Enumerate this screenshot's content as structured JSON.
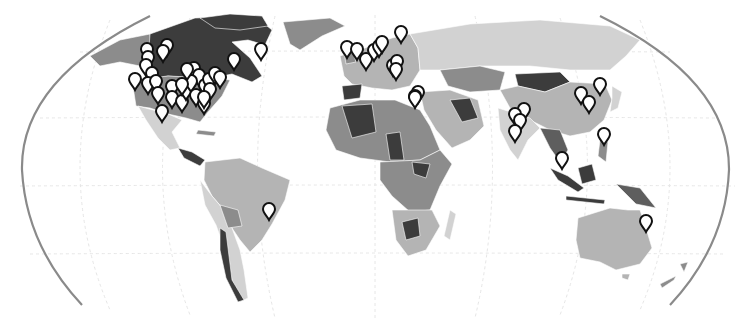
{
  "map": {
    "title": "",
    "projection": "Robinson (cropped)",
    "type": "choropleth-with-markers",
    "palette": {
      "background": "#ffffff",
      "frame": "#8a8a8a",
      "graticule": "#e6e6e6",
      "shade_darkest": "#3c3c3c",
      "shade_dark": "#5e5e5e",
      "shade_mid": "#8c8c8c",
      "shade_light": "#b4b4b4",
      "shade_lightest": "#d2d2d2",
      "marker_fill": "#ffffff",
      "marker_stroke": "#111111"
    },
    "regions": [
      {
        "name": "Alaska",
        "shade": "shade_mid"
      },
      {
        "name": "Canada",
        "shade": "shade_darkest"
      },
      {
        "name": "United States",
        "shade": "shade_mid"
      },
      {
        "name": "Greenland",
        "shade": "shade_mid"
      },
      {
        "name": "Mexico",
        "shade": "shade_lightest"
      },
      {
        "name": "Central America",
        "shade": "shade_darkest"
      },
      {
        "name": "Brazil",
        "shade": "shade_light"
      },
      {
        "name": "South America West",
        "shade": "shade_lightest"
      },
      {
        "name": "Bolivia",
        "shade": "shade_mid"
      },
      {
        "name": "Chile",
        "shade": "shade_darkest"
      },
      {
        "name": "Europe",
        "shade": "shade_light"
      },
      {
        "name": "Russia",
        "shade": "shade_lightest"
      },
      {
        "name": "China",
        "shade": "shade_light"
      },
      {
        "name": "Mongolia",
        "shade": "shade_darkest"
      },
      {
        "name": "Kazakhstan",
        "shade": "shade_mid"
      },
      {
        "name": "Middle East",
        "shade": "shade_light"
      },
      {
        "name": "India",
        "shade": "shade_lightest"
      },
      {
        "name": "Southeast Asia",
        "shade": "shade_dark"
      },
      {
        "name": "Indonesia",
        "shade": "shade_darkest"
      },
      {
        "name": "North Africa",
        "shade": "shade_mid"
      },
      {
        "name": "Central Africa",
        "shade": "shade_mid"
      },
      {
        "name": "Southern Africa",
        "shade": "shade_light"
      },
      {
        "name": "Madagascar",
        "shade": "shade_lightest"
      },
      {
        "name": "Australia",
        "shade": "shade_lightest"
      },
      {
        "name": "New Zealand",
        "shade": "shade_mid"
      },
      {
        "name": "Japan",
        "shade": "shade_lightest"
      }
    ],
    "marker_count": 72,
    "markers": [
      {
        "region": "Canada West",
        "x": 147,
        "y": 60
      },
      {
        "region": "Canada West",
        "x": 148,
        "y": 68
      },
      {
        "region": "Canada West",
        "x": 146,
        "y": 76
      },
      {
        "region": "Canada West",
        "x": 152,
        "y": 84
      },
      {
        "region": "Canada West",
        "x": 167,
        "y": 56
      },
      {
        "region": "Canada West",
        "x": 163,
        "y": 62
      },
      {
        "region": "Canada East",
        "x": 234,
        "y": 70
      },
      {
        "region": "Canada East",
        "x": 261,
        "y": 60
      },
      {
        "region": "US West",
        "x": 135,
        "y": 90
      },
      {
        "region": "US West",
        "x": 148,
        "y": 94
      },
      {
        "region": "US West",
        "x": 156,
        "y": 92
      },
      {
        "region": "US West",
        "x": 158,
        "y": 104
      },
      {
        "region": "US West",
        "x": 162,
        "y": 122
      },
      {
        "region": "US Central",
        "x": 172,
        "y": 97
      },
      {
        "region": "US Central",
        "x": 172,
        "y": 108
      },
      {
        "region": "US Central",
        "x": 182,
        "y": 112
      },
      {
        "region": "US Central",
        "x": 186,
        "y": 100
      },
      {
        "region": "US Central",
        "x": 194,
        "y": 79
      },
      {
        "region": "US Central",
        "x": 199,
        "y": 86
      },
      {
        "region": "US Central",
        "x": 191,
        "y": 92
      },
      {
        "region": "US Central",
        "x": 196,
        "y": 106
      },
      {
        "region": "US East",
        "x": 205,
        "y": 96
      },
      {
        "region": "US East",
        "x": 209,
        "y": 90
      },
      {
        "region": "US East",
        "x": 215,
        "y": 84
      },
      {
        "region": "US East",
        "x": 220,
        "y": 88
      },
      {
        "region": "US East",
        "x": 210,
        "y": 100
      },
      {
        "region": "US East",
        "x": 204,
        "y": 114
      },
      {
        "region": "US East",
        "x": 187,
        "y": 80
      },
      {
        "region": "US East",
        "x": 182,
        "y": 95
      },
      {
        "region": "US Southeast",
        "x": 204,
        "y": 108
      },
      {
        "region": "UK",
        "x": 347,
        "y": 58
      },
      {
        "region": "Ireland",
        "x": 357,
        "y": 60
      },
      {
        "region": "France",
        "x": 366,
        "y": 70
      },
      {
        "region": "Belgium",
        "x": 374,
        "y": 61
      },
      {
        "region": "Netherlands",
        "x": 379,
        "y": 57
      },
      {
        "region": "Germany",
        "x": 382,
        "y": 53
      },
      {
        "region": "Scandinavia",
        "x": 401,
        "y": 43
      },
      {
        "region": "Austria",
        "x": 393,
        "y": 76
      },
      {
        "region": "Hungary",
        "x": 397,
        "y": 72
      },
      {
        "region": "Croatia",
        "x": 396,
        "y": 80
      },
      {
        "region": "Turkey",
        "x": 418,
        "y": 103
      },
      {
        "region": "Greece",
        "x": 415,
        "y": 107
      },
      {
        "region": "Egypt",
        "x": 415,
        "y": 108
      },
      {
        "region": "India North",
        "x": 524,
        "y": 120
      },
      {
        "region": "India North",
        "x": 515,
        "y": 125
      },
      {
        "region": "India",
        "x": 520,
        "y": 131
      },
      {
        "region": "India South",
        "x": 515,
        "y": 142
      },
      {
        "region": "China East",
        "x": 581,
        "y": 104
      },
      {
        "region": "China East",
        "x": 589,
        "y": 113
      },
      {
        "region": "Korea",
        "x": 600,
        "y": 95
      },
      {
        "region": "Philippines",
        "x": 604,
        "y": 145
      },
      {
        "region": "Singapore",
        "x": 562,
        "y": 169
      },
      {
        "region": "Australia East",
        "x": 646,
        "y": 232
      },
      {
        "region": "Brazil Southeast",
        "x": 269,
        "y": 220
      }
    ]
  }
}
